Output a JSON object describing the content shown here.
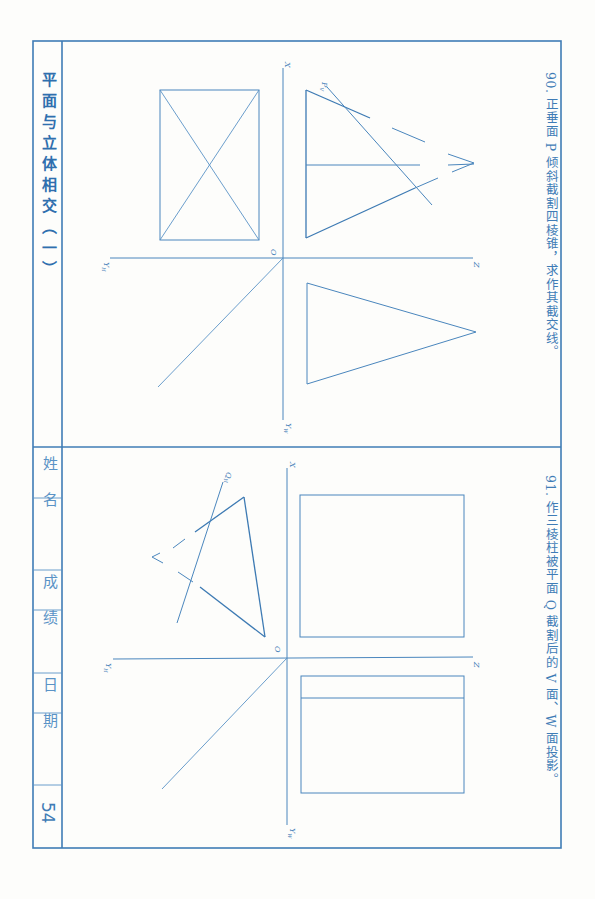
{
  "sheet": {
    "title": "平面与立体相交（一）",
    "page_number": "54",
    "info_fields": [
      {
        "label": "姓 名",
        "value": ""
      },
      {
        "label": "成 绩",
        "value": ""
      },
      {
        "label": "日 期",
        "value": ""
      }
    ],
    "colors": {
      "ink": "#3f7cb6",
      "paper": "#fdfdfb"
    }
  },
  "problems": [
    {
      "number": "90.",
      "text": "90. 正垂面 P 倾斜截割四棱锥，求作其截交线。",
      "plane_label": "P",
      "plane_sub": "V",
      "axes": {
        "x": "X",
        "z": "Z",
        "o": "O",
        "yh": "Y",
        "yh_sub": "H",
        "yw": "Y",
        "yw_sub": "W"
      }
    },
    {
      "number": "91.",
      "text": "91. 作三棱柱被平面 Q 截割后的 V 面、W 面投影。",
      "plane_label": "Q",
      "plane_sub": "H",
      "axes": {
        "x": "X",
        "z": "Z",
        "o": "O",
        "yh": "Y",
        "yh_sub": "H",
        "yw": "Y",
        "yw_sub": "W"
      }
    }
  ]
}
